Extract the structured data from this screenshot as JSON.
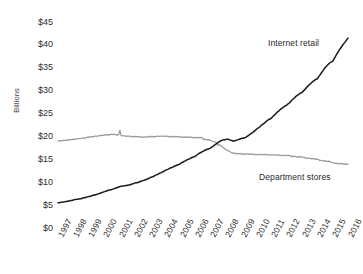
{
  "chart_data": {
    "type": "line",
    "title": "",
    "xlabel": "",
    "ylabel": "Billions",
    "ylim": [
      0,
      45
    ],
    "ytick_labels": [
      "$45",
      "$40",
      "$35",
      "$30",
      "$25",
      "$20",
      "$15",
      "$10",
      "$5",
      "$0"
    ],
    "ytick_values": [
      45,
      40,
      35,
      30,
      25,
      20,
      15,
      10,
      5,
      0
    ],
    "grid": false,
    "legend_position": "inline-annotation",
    "categories": [
      "1997",
      "1998",
      "1999",
      "2000",
      "2001",
      "2002",
      "2003",
      "2004",
      "2005",
      "2006",
      "2007",
      "2008",
      "2009",
      "2010",
      "2011",
      "2012",
      "2013",
      "2014",
      "2015",
      "2016"
    ],
    "x": [
      1997,
      1998,
      1999,
      2000,
      2001,
      2002,
      2003,
      2004,
      2005,
      2006,
      2007,
      2008,
      2009,
      2010,
      2011,
      2012,
      2013,
      2014,
      2015,
      2016
    ],
    "series": [
      {
        "name": "Internet retail",
        "color": "#1a1a1a",
        "values": [
          5.5,
          6.3,
          7.2,
          8.2,
          9.1,
          9.9,
          11.0,
          12.4,
          13.9,
          15.6,
          17.4,
          19.3,
          19.6,
          21.5,
          24.0,
          26.8,
          29.6,
          32.6,
          36.4,
          41.5
        ],
        "monthly": [
          5.5,
          5.5,
          5.6,
          5.6,
          5.7,
          5.7,
          5.8,
          5.8,
          5.9,
          5.9,
          6.0,
          6.0,
          6.1,
          6.2,
          6.2,
          6.3,
          6.3,
          6.4,
          6.4,
          6.5,
          6.6,
          6.6,
          6.7,
          6.8,
          6.9,
          6.9,
          7.0,
          7.1,
          7.2,
          7.2,
          7.3,
          7.4,
          7.5,
          7.6,
          7.7,
          7.8,
          7.9,
          8.0,
          8.1,
          8.2,
          8.3,
          8.3,
          8.4,
          8.5,
          8.6,
          8.7,
          8.8,
          8.9,
          9.0,
          9.1,
          9.1,
          9.2,
          9.2,
          9.3,
          9.3,
          9.4,
          9.4,
          9.5,
          9.6,
          9.7,
          9.8,
          9.9,
          9.9,
          10.0,
          10.1,
          10.2,
          10.3,
          10.4,
          10.5,
          10.6,
          10.7,
          10.8,
          11.0,
          11.1,
          11.2,
          11.3,
          11.5,
          11.6,
          11.7,
          11.9,
          12.0,
          12.1,
          12.3,
          12.4,
          12.6,
          12.7,
          12.8,
          13.0,
          13.1,
          13.2,
          13.3,
          13.5,
          13.6,
          13.7,
          13.8,
          13.9,
          14.1,
          14.3,
          14.4,
          14.6,
          14.7,
          14.9,
          15.0,
          15.1,
          15.3,
          15.4,
          15.5,
          15.6,
          15.8,
          16.0,
          16.2,
          16.4,
          16.5,
          16.7,
          16.8,
          17.0,
          17.1,
          17.2,
          17.3,
          17.4,
          17.6,
          17.8,
          18.0,
          18.2,
          18.4,
          18.6,
          18.8,
          19.0,
          19.1,
          19.2,
          19.3,
          19.3,
          19.4,
          19.4,
          19.3,
          19.2,
          19.1,
          19.0,
          19.0,
          19.1,
          19.2,
          19.3,
          19.4,
          19.5,
          19.6,
          19.6,
          19.7,
          19.8,
          20.0,
          20.2,
          20.4,
          20.6,
          20.8,
          21.0,
          21.2,
          21.5,
          21.7,
          21.9,
          22.1,
          22.4,
          22.6,
          22.8,
          23.0,
          23.3,
          23.5,
          23.7,
          23.8,
          24.0,
          24.3,
          24.6,
          24.8,
          25.1,
          25.4,
          25.6,
          25.9,
          26.1,
          26.3,
          26.5,
          26.7,
          26.8,
          27.1,
          27.3,
          27.6,
          27.9,
          28.2,
          28.4,
          28.7,
          28.9,
          29.1,
          29.3,
          29.5,
          29.6,
          29.9,
          30.2,
          30.5,
          30.8,
          31.1,
          31.4,
          31.6,
          31.9,
          32.1,
          32.3,
          32.5,
          32.6,
          33.0,
          33.4,
          33.8,
          34.2,
          34.6,
          35.0,
          35.3,
          35.6,
          35.9,
          36.1,
          36.3,
          36.4,
          36.9,
          37.4,
          37.9,
          38.3,
          38.8,
          39.2,
          39.6,
          40.0,
          40.4,
          40.7,
          41.1,
          41.5
        ]
      },
      {
        "name": "Department stores",
        "color": "#9a9a9a",
        "values": [
          19.0,
          19.4,
          19.8,
          20.3,
          20.4,
          20.0,
          19.9,
          20.0,
          19.9,
          19.8,
          19.3,
          18.0,
          16.3,
          16.2,
          16.1,
          15.9,
          15.6,
          15.2,
          14.7,
          14.1
        ],
        "monthly": [
          19.0,
          19.0,
          19.1,
          19.0,
          19.1,
          19.2,
          19.1,
          19.2,
          19.3,
          19.2,
          19.3,
          19.3,
          19.4,
          19.3,
          19.4,
          19.5,
          19.4,
          19.5,
          19.6,
          19.5,
          19.6,
          19.7,
          19.6,
          19.7,
          19.8,
          19.9,
          19.8,
          19.9,
          20.0,
          19.9,
          20.0,
          20.1,
          20.0,
          20.1,
          20.2,
          20.1,
          20.3,
          20.2,
          20.3,
          20.4,
          20.3,
          20.4,
          20.3,
          20.4,
          20.5,
          20.4,
          20.5,
          20.4,
          20.4,
          20.3,
          20.4,
          21.4,
          20.2,
          20.1,
          20.2,
          20.1,
          20.0,
          20.1,
          20.0,
          20.1,
          20.0,
          19.9,
          20.0,
          19.9,
          20.0,
          19.9,
          20.0,
          19.9,
          19.8,
          19.9,
          19.8,
          19.9,
          19.9,
          19.8,
          19.9,
          20.0,
          19.9,
          20.0,
          19.9,
          20.0,
          19.9,
          20.0,
          20.1,
          20.0,
          20.0,
          20.1,
          20.0,
          20.1,
          20.0,
          20.1,
          20.0,
          19.9,
          20.0,
          19.9,
          20.0,
          19.9,
          19.9,
          20.0,
          19.9,
          20.0,
          19.9,
          19.8,
          19.9,
          19.8,
          19.9,
          19.8,
          19.9,
          19.8,
          19.8,
          19.9,
          19.8,
          19.7,
          19.8,
          19.7,
          19.8,
          19.7,
          19.8,
          19.7,
          19.8,
          19.7,
          19.3,
          19.4,
          19.3,
          19.2,
          19.3,
          19.2,
          19.1,
          19.0,
          18.9,
          18.8,
          18.7,
          18.6,
          18.0,
          18.2,
          18.0,
          17.8,
          17.6,
          17.4,
          17.2,
          17.0,
          16.9,
          16.8,
          16.6,
          16.5,
          16.3,
          16.4,
          16.3,
          16.2,
          16.3,
          16.2,
          16.3,
          16.2,
          16.1,
          16.2,
          16.1,
          16.2,
          16.2,
          16.1,
          16.2,
          16.1,
          16.2,
          16.1,
          16.0,
          16.1,
          16.0,
          16.1,
          16.0,
          16.1,
          16.1,
          16.0,
          16.1,
          16.0,
          16.1,
          16.0,
          15.9,
          16.0,
          15.9,
          16.0,
          15.9,
          16.0,
          15.9,
          16.0,
          15.9,
          15.8,
          15.9,
          15.8,
          15.9,
          15.8,
          15.9,
          15.8,
          15.9,
          15.8,
          15.6,
          15.7,
          15.6,
          15.7,
          15.6,
          15.5,
          15.6,
          15.5,
          15.6,
          15.5,
          15.4,
          15.5,
          15.2,
          15.3,
          15.2,
          15.3,
          15.2,
          15.1,
          15.2,
          15.1,
          15.0,
          15.1,
          15.0,
          14.9,
          14.7,
          14.8,
          14.7,
          14.6,
          14.7,
          14.6,
          14.5,
          14.6,
          14.5,
          14.4,
          14.3,
          14.2,
          14.1,
          14.2,
          14.1,
          14.0,
          14.1,
          14.0,
          14.1,
          14.0,
          13.9,
          14.0,
          13.9,
          14.0
        ]
      }
    ],
    "annotations": [
      {
        "name": "internet-retail",
        "text": "Internet retail"
      },
      {
        "name": "department-stores",
        "text": "Department stores"
      }
    ]
  }
}
